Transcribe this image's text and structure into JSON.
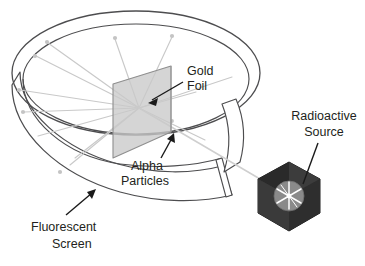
{
  "diagram": {
    "labels": {
      "gold_foil": {
        "line1": "Gold",
        "line2": "Foil"
      },
      "alpha_particles": {
        "line1": "Alpha",
        "line2": "Particles"
      },
      "fluorescent_screen": {
        "line1": "Fluorescent",
        "line2": "Screen"
      },
      "radioactive_source": {
        "line1": "Radioactive",
        "line2": "Source"
      }
    },
    "colors": {
      "background": "#ffffff",
      "text": "#231f20",
      "outline": "#4d4d4f",
      "ray": "#c7c7c7",
      "ray_dot": "#bdbdbd",
      "foil_fill": "#c9c9c9",
      "foil_edge": "#8c8c8c",
      "source_dark": "#2b2b2b",
      "source_mid": "#3f3f3f",
      "source_light": "#5a5a5a",
      "source_disc": "#8e8e8e",
      "starburst": "#ffffff",
      "arrow": "#1a1a1a"
    },
    "components": [
      {
        "name": "fluorescent-screen-ring",
        "shape": "open cylinder ring",
        "opening": "right"
      },
      {
        "name": "gold-foil",
        "shape": "parallelogram",
        "position": "center"
      },
      {
        "name": "alpha-particle-rays",
        "count": 12,
        "origin": "gold foil center"
      },
      {
        "name": "radioactive-source",
        "shape": "hexagonal block",
        "position": "lower right"
      },
      {
        "name": "alpha-beam",
        "path": "source to gold foil"
      }
    ]
  }
}
